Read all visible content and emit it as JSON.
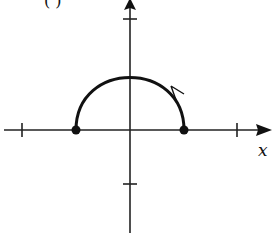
{
  "figure": {
    "part_label": "( )",
    "x_axis_label": "x",
    "colors": {
      "ink": "#111111",
      "background": "#ffffff"
    },
    "axes": {
      "origin_px": [
        130,
        130
      ],
      "x_ticks_px": [
        22,
        237
      ],
      "y_ticks_px": [
        19,
        240
      ]
    },
    "curve": {
      "type": "upper semicircle",
      "left_endpoint_px": [
        76,
        130
      ],
      "right_endpoint_px": [
        184,
        130
      ],
      "top_px": [
        130,
        74
      ],
      "endpoints": "closed dots",
      "direction_arrow": "on right side of arc"
    }
  }
}
